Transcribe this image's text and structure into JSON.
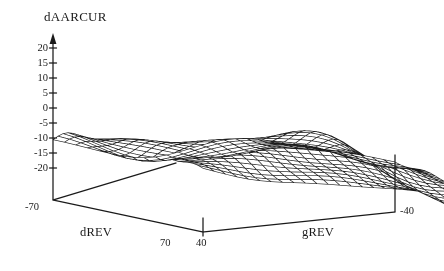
{
  "figure": {
    "kind": "3d-surface-wireframe",
    "background_color": "#ffffff",
    "line_color": "#1a1a1a",
    "width": 444,
    "height": 271
  },
  "labels": {
    "z_axis_title": "dAARCUR",
    "x_axis_title": "dREV",
    "y_axis_title": "gREV",
    "x_near_corner": "70",
    "y_near_corner": "40",
    "x_far_corner": "-70",
    "y_far_corner": "-40"
  },
  "z_ticks": [
    "20",
    "15",
    "10",
    "5",
    "0",
    "-5",
    "-10",
    "-15",
    "-20"
  ],
  "chart_data": {
    "type": "surface",
    "title": "dAARCUR",
    "xlabel": "dREV",
    "ylabel": "gREV",
    "zlabel": "dAARCUR",
    "grid": false,
    "legend": "none",
    "xlim": [
      -70,
      70
    ],
    "ylim": [
      -40,
      40
    ],
    "zlim": [
      -20,
      22
    ],
    "z_tick_values": [
      20,
      15,
      10,
      5,
      0,
      -5,
      -10,
      -15,
      -20
    ],
    "x_axis_tick_labels_shown": [
      "-70",
      "70"
    ],
    "y_axis_tick_labels_shown": [
      "40",
      "-40"
    ],
    "mesh": {
      "nx": 31,
      "ny": 31
    },
    "view": {
      "elev_deg": 22,
      "azim_deg": -52
    },
    "features": [
      {
        "name": "left-shelf",
        "approx_z": 5
      },
      {
        "name": "back-ridge-peak",
        "approx_z": 22
      },
      {
        "name": "front-diagonal-trough",
        "approx_z": -15
      },
      {
        "name": "right-shelf",
        "approx_z": -7
      }
    ],
    "z_grid_note": "Surface heights are generated analytically in the renderer from the feature description; sampled on a 31x31 grid over x in [-70,70], y in [-40,40].",
    "z_samples": {
      "x": [
        -70,
        -35,
        0,
        35,
        70
      ],
      "y": [
        40,
        20,
        0,
        -20,
        -40
      ],
      "values": [
        [
          5,
          5,
          4,
          4,
          5
        ],
        [
          4,
          8,
          14,
          9,
          3
        ],
        [
          0,
          6,
          18,
          10,
          -2
        ],
        [
          -8,
          -10,
          2,
          -4,
          -6
        ],
        [
          -14,
          -15,
          -6,
          -7,
          -7
        ]
      ]
    }
  }
}
